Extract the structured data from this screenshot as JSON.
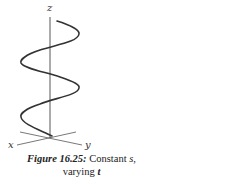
{
  "figure": {
    "axes": {
      "x_label": "x",
      "y_label": "y",
      "z_label": "z"
    },
    "curve": {
      "type": "helix",
      "turns": 2,
      "stroke": "#333333"
    }
  },
  "caption": {
    "label": "Figure 16.25:",
    "text_before_s": " Constant ",
    "var_s": "s",
    "text_after_s": ",",
    "line2_text": "varying ",
    "var_t": "t"
  }
}
